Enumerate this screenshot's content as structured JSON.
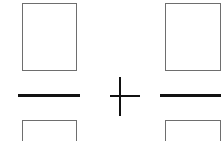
{
  "diagram": {
    "type": "fraction-addition-template",
    "operator": "+",
    "left_fraction": {
      "numerator_box": "empty",
      "fraction_bar": true,
      "denominator_box": "empty"
    },
    "right_fraction": {
      "numerator_box": "empty",
      "fraction_bar": true,
      "denominator_box": "empty"
    },
    "colors": {
      "box_border": "#6e6e6e",
      "stroke": "#111111",
      "background": "#ffffff"
    }
  }
}
